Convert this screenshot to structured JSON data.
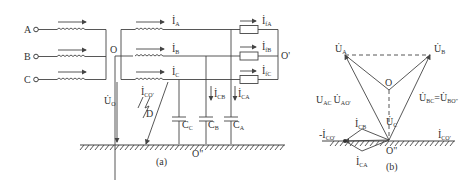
{
  "figure_a": {
    "caption": "(a)",
    "sources": [
      "A",
      "B",
      "C"
    ],
    "neutral_left": "O",
    "neutral_right": "O'",
    "ground_point": "O\"",
    "fault_point": "D",
    "line_currents": [
      {
        "main": "İ",
        "sub": "A"
      },
      {
        "main": "İ",
        "sub": "B"
      },
      {
        "main": "İ",
        "sub": "C"
      }
    ],
    "load_currents": [
      {
        "main": "İ",
        "sub": "fA"
      },
      {
        "main": "İ",
        "sub": "fB"
      },
      {
        "main": "İ",
        "sub": "fC"
      }
    ],
    "capacitor_currents": [
      {
        "main": "İ",
        "sub": "CB"
      },
      {
        "main": "İ",
        "sub": "CA"
      }
    ],
    "fault_current": {
      "main": "İ",
      "sub": "CO'"
    },
    "neutral_voltage": {
      "main": "U̇",
      "sub": "O"
    },
    "capacitors": [
      {
        "main": "C",
        "sub": "C"
      },
      {
        "main": "C",
        "sub": "B"
      },
      {
        "main": "C",
        "sub": "A"
      }
    ]
  },
  "figure_b": {
    "caption": "(b)",
    "UA": {
      "main": "U̇",
      "sub": "A"
    },
    "UB": {
      "main": "U̇",
      "sub": "B"
    },
    "UC": {
      "main": "U̇",
      "sub": "C"
    },
    "O": "O",
    "ground": "O\"",
    "left_eq": "U_AC = U̇_AO'",
    "left_eq_parts": {
      "a": "U",
      "a_sub": "AC",
      "eq": "=",
      "b": "U̇",
      "b_sub": "AO'"
    },
    "right_eq_parts": {
      "a": "U̇",
      "a_sub": "BC",
      "eq": "=",
      "b": "U̇",
      "b_sub": "BO\""
    },
    "ICB": {
      "main": "İ",
      "sub": "CB"
    },
    "ICA": {
      "main": "İ",
      "sub": "CA"
    },
    "ICO_pos": {
      "main": "İ",
      "sub": "CO'"
    },
    "ICO_neg": {
      "main": "-İ",
      "sub": "CO'"
    }
  }
}
